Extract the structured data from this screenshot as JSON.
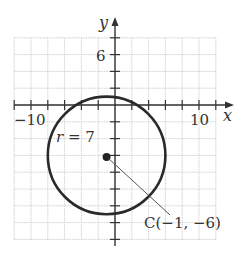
{
  "figure": {
    "axes": {
      "x_label": "x",
      "y_label": "y",
      "x_tick_labels": [
        {
          "value": -10,
          "text": "−10"
        },
        {
          "value": 10,
          "text": "10"
        }
      ],
      "y_tick_labels": [
        {
          "value": 6,
          "text": "6"
        }
      ],
      "x_range": [
        -12,
        12
      ],
      "y_range": [
        -16,
        8
      ],
      "tick_step": 2,
      "grid_step": 2
    },
    "circle": {
      "center": [
        -1,
        -6
      ],
      "radius": 7,
      "radius_label": "r = 7",
      "center_label": "C(−1, −6)"
    },
    "colors": {
      "grid": "#c8c8c8",
      "axis": "#333333",
      "curve": "#2a2a2a",
      "background": "#ffffff"
    }
  }
}
